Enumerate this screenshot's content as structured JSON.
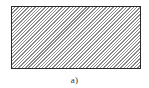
{
  "figure": {
    "shape": "rectangle",
    "fill": "diagonal-hatching",
    "hatch_direction": "bottom-left-to-top-right",
    "stroke_color": "#2a2a2a",
    "hatch_color": "#8a8a8a",
    "caption": "a)"
  }
}
